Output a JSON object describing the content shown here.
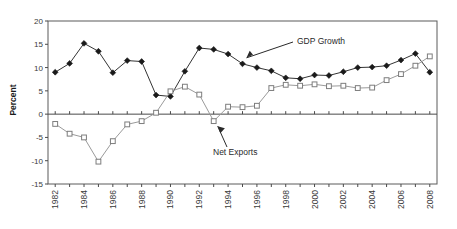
{
  "chart_data": {
    "type": "line",
    "title": "",
    "xlabel": "",
    "ylabel": "Percent",
    "ylim": [
      -15,
      20
    ],
    "yticks": [
      20,
      15,
      10,
      5,
      0,
      -5,
      -10,
      -15
    ],
    "grid": false,
    "legend": "none",
    "x": [
      1982,
      1983,
      1984,
      1985,
      1986,
      1987,
      1988,
      1989,
      1990,
      1991,
      1992,
      1993,
      1994,
      1995,
      1996,
      1997,
      1998,
      1999,
      2000,
      2001,
      2002,
      2003,
      2004,
      2005,
      2006,
      2007,
      2008
    ],
    "xtick_labels": [
      "1982",
      "1984",
      "1986",
      "1988",
      "1990",
      "1992",
      "1994",
      "1996",
      "1998",
      "2000",
      "2002",
      "2004",
      "2006",
      "2008"
    ],
    "series": [
      {
        "name": "GDP Growth",
        "marker": "filled-diamond",
        "color": "#1a1a1a",
        "values": [
          9.0,
          10.9,
          15.2,
          13.5,
          8.9,
          11.5,
          11.3,
          4.1,
          3.8,
          9.2,
          14.2,
          13.9,
          12.9,
          10.8,
          10.0,
          9.3,
          7.8,
          7.6,
          8.4,
          8.3,
          9.1,
          10.0,
          10.1,
          10.4,
          11.6,
          13.0,
          9.0
        ]
      },
      {
        "name": "Net Exports",
        "marker": "open-square",
        "color": "#7d7d7d",
        "values": [
          -2.1,
          -4.2,
          -5.0,
          -10.2,
          -5.8,
          -2.2,
          -1.5,
          0.3,
          4.9,
          5.9,
          4.2,
          -1.5,
          1.6,
          1.5,
          1.8,
          5.6,
          6.3,
          6.1,
          6.4,
          6.0,
          6.1,
          5.6,
          5.7,
          7.3,
          8.6,
          10.4,
          12.4
        ]
      }
    ],
    "annotations": [
      {
        "text": "GDP Growth",
        "points_to_year": 1995,
        "points_to_value": 10.8
      },
      {
        "text": "Net Exports",
        "points_to_year": 1993,
        "points_to_value": -1.5
      }
    ]
  }
}
